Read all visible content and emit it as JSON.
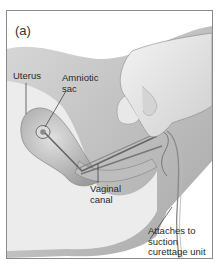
{
  "figure": {
    "panel_label": "(a)",
    "labels": {
      "uterus": "Uterus",
      "amniotic_sac": [
        "Amniotic",
        "sac"
      ],
      "vaginal_canal": [
        "Vaginal",
        "canal"
      ],
      "suction_unit": [
        "Attaches to",
        "suction",
        "curettage unit"
      ]
    },
    "colors": {
      "border": "#8a8a8a",
      "tissue_dark": "#9a9a9a",
      "tissue_mid": "#c4c4c4",
      "tissue_light": "#e6e6e6",
      "text": "#2a2a2a"
    }
  }
}
